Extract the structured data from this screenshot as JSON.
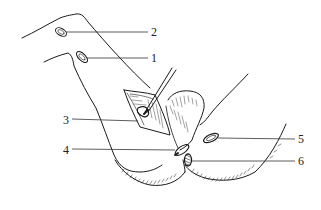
{
  "figure": {
    "type": "anatomical-line-illustration",
    "colors": {
      "stroke": "#1a1a1a",
      "leader": "#333333",
      "background": "#ffffff"
    },
    "labels": [
      {
        "id": "1",
        "text": "1"
      },
      {
        "id": "2",
        "text": "2"
      },
      {
        "id": "3",
        "text": "3"
      },
      {
        "id": "4",
        "text": "4"
      },
      {
        "id": "5",
        "text": "5"
      },
      {
        "id": "6",
        "text": "6"
      }
    ]
  }
}
